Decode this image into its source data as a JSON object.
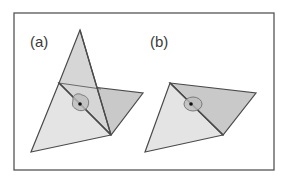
{
  "figure": {
    "panels": [
      {
        "label": "(a)",
        "description": "two triangles sharing an edge, folded, with vertex star region marked"
      },
      {
        "label": "(b)",
        "description": "two adjacent triangles forming a quadrilateral with vertex star region marked"
      }
    ],
    "colors": {
      "frame": "#555555",
      "edge": "#4a4a4a",
      "light_fill": "#e4e4e4",
      "dark_fill": "#c9c9c9",
      "ring_fill": "#bdbdbd",
      "ring_stroke": "#7a7a7a",
      "dot": "#111111"
    }
  }
}
